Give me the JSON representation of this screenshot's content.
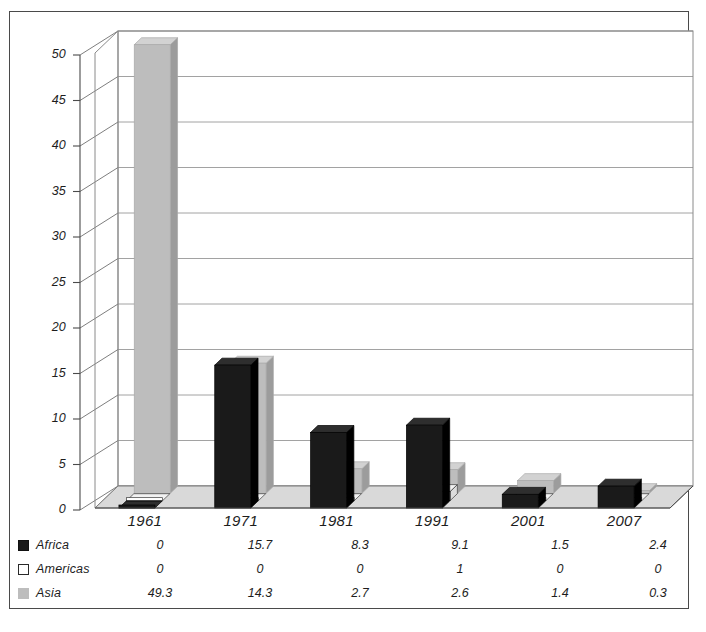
{
  "chart_data": {
    "type": "bar",
    "title": "",
    "subtitle": "",
    "xlabel": "",
    "ylabel": "",
    "categories": [
      "1961",
      "1971",
      "1981",
      "1991",
      "2001",
      "2007"
    ],
    "series": [
      {
        "name": "Africa",
        "color": "#1a1a1a",
        "values": [
          0,
          15.7,
          8.3,
          9.1,
          1.5,
          2.4
        ]
      },
      {
        "name": "Americas",
        "color": "#ffffff",
        "values": [
          0,
          0,
          0,
          1,
          0,
          0
        ]
      },
      {
        "name": "Asia",
        "color": "#bdbdbd",
        "values": [
          49.3,
          14.3,
          2.7,
          2.6,
          1.4,
          0.3
        ]
      }
    ],
    "ylim": [
      0,
      50
    ],
    "yticks": [
      "0",
      "5",
      "10",
      "15",
      "20",
      "25",
      "30",
      "35",
      "40",
      "45",
      "50"
    ],
    "grid": true,
    "legend_position": "bottom-table",
    "style": "3d-clustered-column",
    "data_table_visible": true
  },
  "axis": {
    "y_tick_labels": [
      "50",
      "45",
      "40",
      "35",
      "30",
      "25",
      "20",
      "15",
      "10",
      "5",
      "0"
    ],
    "x_tick_labels": [
      "1961",
      "1971",
      "1981",
      "1991",
      "2001",
      "2007"
    ]
  },
  "table": {
    "row_labels": [
      "Africa",
      "Americas",
      "Asia"
    ],
    "rows": [
      {
        "label": "Africa",
        "icon": "filled-square-icon",
        "values": [
          "0",
          "15.7",
          "8.3",
          "9.1",
          "1.5",
          "2.4"
        ]
      },
      {
        "label": "Americas",
        "icon": "hollow-square-icon",
        "values": [
          "0",
          "0",
          "0",
          "1",
          "0",
          "0"
        ]
      },
      {
        "label": "Asia",
        "icon": "gray-square-icon",
        "values": [
          "49.3",
          "14.3",
          "2.7",
          "2.6",
          "1.4",
          "0.3"
        ]
      }
    ]
  },
  "colors": {
    "africa": "#1a1a1a",
    "americas": "#ffffff",
    "asia": "#bdbdbd",
    "floor": "#d9d9d9",
    "grid": "#8a8a8a",
    "frame": "#4a4a4a"
  }
}
